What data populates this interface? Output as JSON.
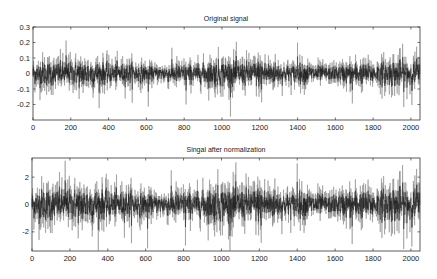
{
  "chart_data": [
    {
      "type": "line",
      "title": "Original signal",
      "xlabel": "",
      "ylabel": "",
      "xlim": [
        0,
        2048
      ],
      "ylim": [
        -0.3,
        0.3
      ],
      "xticks": [
        0,
        200,
        400,
        600,
        800,
        1000,
        1200,
        1400,
        1600,
        1800,
        2000
      ],
      "xtick_labels": [
        "0",
        "200",
        "400",
        "600",
        "800",
        "1000",
        "1200",
        "1400",
        "1600",
        "1800",
        "2000"
      ],
      "yticks": [
        0.3,
        0.2,
        0.1,
        0,
        -0.1,
        -0.2
      ],
      "ytick_labels": [
        "0.3",
        "0.2",
        "0.1",
        "0",
        "-0.1",
        "-0.2"
      ],
      "grid": false,
      "legend": null,
      "series": [
        {
          "name": "Original signal",
          "n_samples": 2048,
          "description": "zero-mean noise-like signal, std approx 0.07",
          "approx_std": 0.07,
          "notable_points": [
            {
              "x": 175,
              "y": 0.25
            },
            {
              "x": 610,
              "y": -0.23
            },
            {
              "x": 810,
              "y": -0.21
            },
            {
              "x": 1210,
              "y": -0.2
            },
            {
              "x": 1400,
              "y": 0.22
            },
            {
              "x": 1690,
              "y": -0.21
            },
            {
              "x": 2030,
              "y": 0.18
            }
          ]
        }
      ],
      "color": "#1a1a1a"
    },
    {
      "type": "line",
      "title": "Singal after normalization",
      "xlabel": "",
      "ylabel": "",
      "xlim": [
        0,
        2048
      ],
      "ylim": [
        -3.4,
        3.4
      ],
      "xticks": [
        0,
        200,
        400,
        600,
        800,
        1000,
        1200,
        1400,
        1600,
        1800,
        2000
      ],
      "xtick_labels": [
        "0",
        "200",
        "400",
        "600",
        "800",
        "1000",
        "1200",
        "1400",
        "1600",
        "1800",
        "2000"
      ],
      "yticks": [
        2,
        0,
        -2
      ],
      "ytick_labels": [
        "2",
        "0",
        "-2"
      ],
      "grid": false,
      "legend": null,
      "series": [
        {
          "name": "Normalized signal",
          "n_samples": 2048,
          "description": "same waveform scaled to unit variance",
          "approx_std": 1.0,
          "notable_points": [
            {
              "x": 175,
              "y": 3.2
            },
            {
              "x": 610,
              "y": -3.2
            },
            {
              "x": 810,
              "y": -3.0
            },
            {
              "x": 1210,
              "y": -2.8
            },
            {
              "x": 1400,
              "y": 3.0
            },
            {
              "x": 1690,
              "y": -2.9
            },
            {
              "x": 2030,
              "y": 2.6
            }
          ]
        }
      ],
      "color": "#1a1a1a"
    }
  ],
  "plots": {
    "top": {
      "title": "Original signal"
    },
    "bottom": {
      "title": "Singal after normalization"
    }
  }
}
